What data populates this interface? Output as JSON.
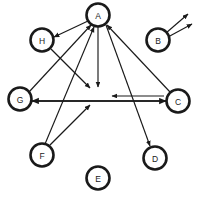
{
  "canvas": {
    "width": 197,
    "height": 197,
    "background": "#ffffff",
    "stroke_color": "#1a1a1a",
    "title": "Directed graph with eight labeled nodes"
  },
  "graph": {
    "node_radius": 11.5,
    "nodes": [
      {
        "id": "A",
        "label": "A",
        "cx": 98,
        "cy": 15,
        "name": "node-a"
      },
      {
        "id": "B",
        "label": "B",
        "cx": 158,
        "cy": 40,
        "name": "node-b"
      },
      {
        "id": "C",
        "label": "C",
        "cx": 178,
        "cy": 101,
        "name": "node-c"
      },
      {
        "id": "D",
        "label": "D",
        "cx": 155,
        "cy": 158,
        "name": "node-d"
      },
      {
        "id": "E",
        "label": "E",
        "cx": 98,
        "cy": 178,
        "name": "node-e"
      },
      {
        "id": "F",
        "label": "F",
        "cx": 42,
        "cy": 155,
        "name": "node-f"
      },
      {
        "id": "G",
        "label": "G",
        "cx": 20,
        "cy": 99,
        "name": "node-g"
      },
      {
        "id": "H",
        "label": "H",
        "cx": 42,
        "cy": 40,
        "name": "node-h"
      }
    ],
    "edges": [
      {
        "id": "a-to-h",
        "from": "A",
        "to": "H",
        "x1": 88,
        "y1": 21,
        "x2": 54,
        "y2": 37,
        "arrow": "end",
        "name": "edge-a-to-h"
      },
      {
        "id": "a-to-down",
        "from": "A",
        "to": "(dangling)",
        "x1": 98,
        "y1": 27,
        "x2": 98,
        "y2": 87,
        "arrow": "end",
        "name": "edge-a-down"
      },
      {
        "id": "a-to-d",
        "from": "A",
        "to": "D",
        "x1": 106,
        "y1": 25,
        "x2": 150,
        "y2": 146,
        "arrow": "end",
        "name": "edge-a-to-d"
      },
      {
        "id": "h-to-center",
        "from": "H",
        "to": "(dangling)",
        "x1": 51,
        "y1": 49,
        "x2": 90,
        "y2": 88,
        "arrow": "end",
        "name": "edge-h-to-center"
      },
      {
        "id": "g-to-a",
        "from": "G",
        "to": "A",
        "x1": 29,
        "y1": 92,
        "x2": 91,
        "y2": 25,
        "arrow": "end",
        "name": "edge-g-to-a"
      },
      {
        "id": "f-to-a",
        "from": "F",
        "to": "A",
        "x1": 45,
        "y1": 144,
        "x2": 94,
        "y2": 27,
        "arrow": "end",
        "name": "edge-f-to-a"
      },
      {
        "id": "f-to-center",
        "from": "F",
        "to": "(dangling)",
        "x1": 50,
        "y1": 145,
        "x2": 90,
        "y2": 105,
        "arrow": "end",
        "name": "edge-f-to-center"
      },
      {
        "id": "c-to-a",
        "from": "C",
        "to": "A",
        "x1": 170,
        "y1": 92,
        "x2": 107,
        "y2": 25,
        "arrow": "end",
        "name": "edge-c-to-a"
      },
      {
        "id": "g-to-c",
        "from": "G",
        "to": "C",
        "x1": 32,
        "y1": 101,
        "x2": 166,
        "y2": 101,
        "arrow": "end",
        "name": "edge-g-to-c"
      },
      {
        "id": "c-to-g",
        "from": "C",
        "to": "(midpoint)",
        "x1": 164,
        "y1": 96,
        "x2": 112,
        "y2": 96,
        "arrow": "end",
        "name": "edge-c-to-mid"
      },
      {
        "id": "c-to-g-long",
        "from": "C",
        "to": "G",
        "x1": 166,
        "y1": 101,
        "x2": 32,
        "y2": 101,
        "arrow": "end",
        "name": "edge-c-to-g"
      },
      {
        "id": "b-out-1",
        "from": "B",
        "to": "(dangling)",
        "x1": 166,
        "y1": 33,
        "x2": 188,
        "y2": 14,
        "arrow": "end",
        "name": "edge-b-out-upper"
      },
      {
        "id": "b-out-2",
        "from": "B",
        "to": "(dangling)",
        "x1": 168,
        "y1": 37,
        "x2": 192,
        "y2": 24,
        "arrow": "end",
        "name": "edge-b-out-lower"
      }
    ]
  }
}
